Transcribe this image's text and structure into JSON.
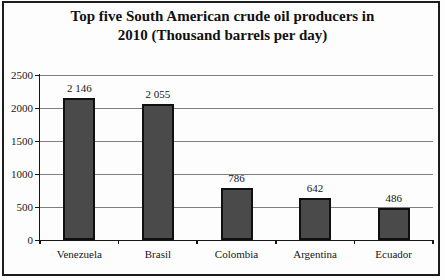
{
  "window": {
    "border_color": "#1c1c1c",
    "background_color": "#fdfdfd"
  },
  "title": {
    "line1": "Top five South American crude oil producers in",
    "line2": "2010 (Thousand barrels per day)"
  },
  "chart_data": {
    "type": "bar",
    "title": "Top five South American crude oil producers in 2010 (Thousand barrels per day)",
    "categories": [
      "Venezuela",
      "Brasil",
      "Colombia",
      "Argentina",
      "Ecuador"
    ],
    "values": [
      2146,
      2055,
      786,
      642,
      486
    ],
    "value_labels": [
      "2 146",
      "2 055",
      "786",
      "642",
      "486"
    ],
    "xlabel": "",
    "ylabel": "",
    "ylim": [
      0,
      2500
    ],
    "ytick_step": 500,
    "ytick_labels": [
      "0",
      "500",
      "1000",
      "1500",
      "2000",
      "2500"
    ],
    "grid": true,
    "legend": "none",
    "colors": {
      "bar_fill": "#4a4a4a",
      "bar_border": "#101010",
      "gridline": "#7f7f7f",
      "axis": "#161616",
      "text": "#161616"
    }
  }
}
